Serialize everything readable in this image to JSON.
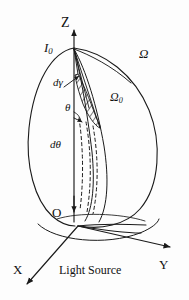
{
  "figure": {
    "caption": "Light Source",
    "axes": {
      "z_label": "Z",
      "x_label": "X",
      "y_label": "Y",
      "origin_label": "O"
    },
    "annotations": {
      "intensity_symbol": "I",
      "intensity_subscript": "0",
      "solid_angle_symbol": "Ω",
      "solid_angle_sub_symbol": "Ω",
      "solid_angle_sub_subscript": "0",
      "d_gamma": "dγ",
      "theta": "θ",
      "d_theta": "dθ"
    },
    "colors": {
      "background": "#fdfdfd",
      "stroke": "#1a1a1a",
      "hatch": "#1a1a1a"
    }
  }
}
